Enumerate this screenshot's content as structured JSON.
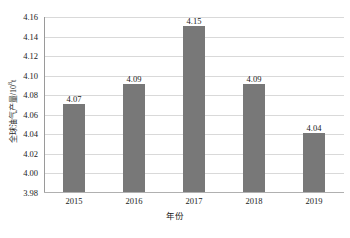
{
  "chart_data": {
    "type": "bar",
    "title": "",
    "categories": [
      "2015",
      "2016",
      "2017",
      "2018",
      "2019"
    ],
    "values": [
      4.07,
      4.09,
      4.15,
      4.09,
      4.04
    ],
    "data_labels": [
      "4.07",
      "4.09",
      "4.15",
      "4.09",
      "4.04"
    ],
    "xlabel": "年份",
    "ylabel": "全球油气产量/10",
    "ylabel_exponent": "8",
    "ylabel_unit_suffix": "t",
    "ylim": [
      3.98,
      4.16
    ],
    "ytick_step": 0.02,
    "ytick_labels": [
      "4.16",
      "4.14",
      "4.12",
      "4.10",
      "4.08",
      "4.06",
      "4.04",
      "4.02",
      "4.00",
      "3.98"
    ],
    "ytick_values": [
      4.16,
      4.14,
      4.12,
      4.1,
      4.08,
      4.06,
      4.04,
      4.02,
      4.0,
      3.98
    ],
    "grid": true,
    "grid_orientation": "horizontal",
    "legend": false,
    "legend_position": "none",
    "bar_color": "#787878",
    "gridline_color": "#d9d9d9",
    "axis_color": "#b0b0b0",
    "background_color": "#ffffff",
    "text_color": "#1a1a1a"
  }
}
